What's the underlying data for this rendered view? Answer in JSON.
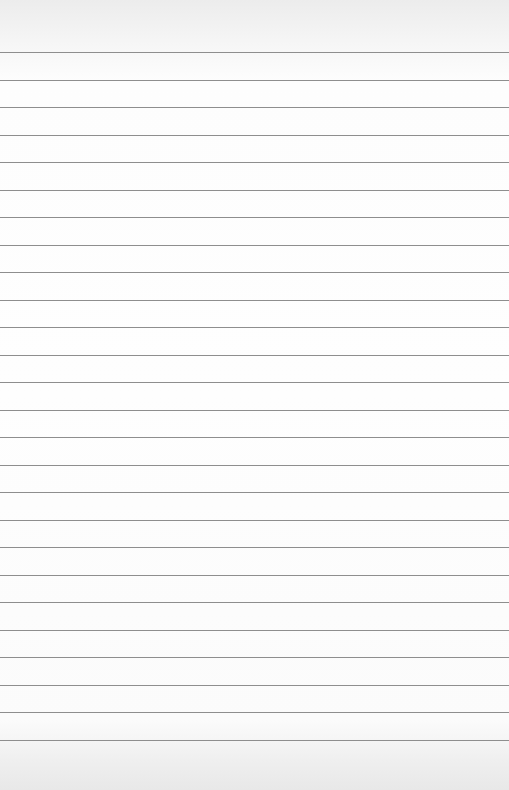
{
  "paper": {
    "type": "lined-paper",
    "background_color": "#fefefe",
    "line_color": "#8e8e8e",
    "line_count": 26,
    "first_line_y": 52,
    "line_spacing": 27.5,
    "text": ""
  }
}
